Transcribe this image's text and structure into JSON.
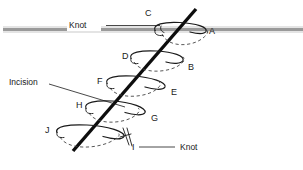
{
  "diagram": {
    "canvas": {
      "width": 303,
      "height": 170,
      "background": "#ffffff"
    },
    "colors": {
      "skin_line": "#9a9a9a",
      "suture": "#0d0d0d",
      "loop_solid": "#1a1a1a",
      "loop_hidden": "#3a3a3a",
      "label_text": "#1a1a1a",
      "page_background": "#ffffff"
    },
    "annotations": {
      "knot_top": "Knot",
      "knot_bottom": "Knot",
      "incision": "Incision"
    },
    "loop_labels": [
      {
        "id": "A",
        "text": "A",
        "x": 209,
        "y": 34
      },
      {
        "id": "B",
        "text": "B",
        "x": 188,
        "y": 70
      },
      {
        "id": "C",
        "text": "C",
        "x": 145,
        "y": 16
      },
      {
        "id": "D",
        "text": "D",
        "x": 122,
        "y": 59
      },
      {
        "id": "E",
        "text": "E",
        "x": 171,
        "y": 95
      },
      {
        "id": "F",
        "text": "F",
        "x": 97,
        "y": 84
      },
      {
        "id": "G",
        "text": "G",
        "x": 151,
        "y": 121
      },
      {
        "id": "H",
        "text": "H",
        "x": 76,
        "y": 108
      },
      {
        "id": "I",
        "text": "I",
        "x": 132,
        "y": 150
      },
      {
        "id": "J",
        "text": "J",
        "x": 45,
        "y": 133
      }
    ]
  }
}
